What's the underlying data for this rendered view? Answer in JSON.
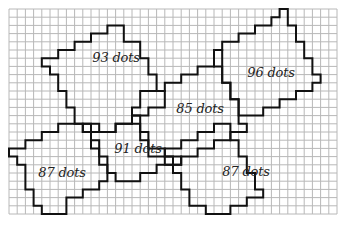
{
  "diagram": {
    "title": "",
    "grid": {
      "origin_px": [
        9,
        9
      ],
      "cell_px": 8.2,
      "cols": 40,
      "rows": 25,
      "line_color": "#b8b8b8",
      "background": "#ffffff"
    },
    "outline_color": "#111111",
    "shapes": [
      {
        "label": "93 dots",
        "label_pos_px": [
          116,
          57
        ],
        "path_grid": [
          [
            13,
            2
          ],
          [
            14,
            2
          ],
          [
            14,
            4
          ],
          [
            16,
            4
          ],
          [
            16,
            6
          ],
          [
            17,
            6
          ],
          [
            17,
            8
          ],
          [
            18,
            8
          ],
          [
            18,
            10
          ],
          [
            19,
            10
          ],
          [
            19,
            12
          ],
          [
            17,
            12
          ],
          [
            17,
            13
          ],
          [
            15,
            13
          ],
          [
            15,
            14
          ],
          [
            13,
            14
          ],
          [
            13,
            15
          ],
          [
            10,
            15
          ],
          [
            10,
            14
          ],
          [
            8,
            14
          ],
          [
            8,
            12
          ],
          [
            7,
            12
          ],
          [
            7,
            10
          ],
          [
            6,
            10
          ],
          [
            6,
            8
          ],
          [
            5,
            8
          ],
          [
            5,
            7
          ],
          [
            4,
            7
          ],
          [
            4,
            6
          ],
          [
            6,
            6
          ],
          [
            6,
            5
          ],
          [
            8,
            5
          ],
          [
            8,
            4
          ],
          [
            10,
            4
          ],
          [
            10,
            3
          ],
          [
            12,
            3
          ],
          [
            12,
            2
          ]
        ]
      },
      {
        "label": "96 dots",
        "label_pos_px": [
          271,
          72
        ],
        "path_grid": [
          [
            33,
            0
          ],
          [
            34,
            0
          ],
          [
            34,
            2
          ],
          [
            35,
            2
          ],
          [
            35,
            4
          ],
          [
            36,
            4
          ],
          [
            36,
            6
          ],
          [
            37,
            6
          ],
          [
            37,
            8
          ],
          [
            38,
            8
          ],
          [
            38,
            9
          ],
          [
            37,
            9
          ],
          [
            37,
            10
          ],
          [
            35,
            10
          ],
          [
            35,
            11
          ],
          [
            33,
            11
          ],
          [
            33,
            12
          ],
          [
            31,
            12
          ],
          [
            31,
            13
          ],
          [
            28,
            13
          ],
          [
            28,
            11
          ],
          [
            27,
            11
          ],
          [
            27,
            9
          ],
          [
            26,
            9
          ],
          [
            26,
            7
          ],
          [
            25,
            7
          ],
          [
            25,
            5
          ],
          [
            26,
            5
          ],
          [
            26,
            4
          ],
          [
            28,
            4
          ],
          [
            28,
            3
          ],
          [
            30,
            3
          ],
          [
            30,
            2
          ],
          [
            32,
            2
          ],
          [
            32,
            1
          ],
          [
            33,
            1
          ]
        ]
      },
      {
        "label": "85 dots",
        "label_pos_px": [
          200,
          108
        ],
        "path_grid": [
          [
            16,
            10
          ],
          [
            19,
            10
          ],
          [
            19,
            9
          ],
          [
            21,
            9
          ],
          [
            21,
            8
          ],
          [
            23,
            8
          ],
          [
            23,
            7
          ],
          [
            25,
            7
          ],
          [
            25,
            5
          ],
          [
            26,
            5
          ],
          [
            26,
            9
          ],
          [
            27,
            9
          ],
          [
            27,
            11
          ],
          [
            28,
            11
          ],
          [
            28,
            14
          ],
          [
            29,
            14
          ],
          [
            29,
            15
          ],
          [
            27,
            15
          ],
          [
            27,
            16
          ],
          [
            25,
            16
          ],
          [
            25,
            17
          ],
          [
            23,
            17
          ],
          [
            23,
            18
          ],
          [
            21,
            18
          ],
          [
            21,
            19
          ],
          [
            19,
            19
          ],
          [
            19,
            18
          ],
          [
            17,
            18
          ],
          [
            17,
            16
          ],
          [
            16,
            16
          ],
          [
            16,
            14
          ],
          [
            15,
            14
          ],
          [
            15,
            12
          ],
          [
            16,
            12
          ]
        ]
      },
      {
        "label": "91 dots",
        "label_pos_px": [
          138,
          148
        ],
        "path_grid": [
          [
            9,
            15
          ],
          [
            10,
            15
          ],
          [
            10,
            16
          ],
          [
            11,
            16
          ],
          [
            11,
            18
          ],
          [
            12,
            18
          ],
          [
            12,
            20
          ],
          [
            13,
            20
          ],
          [
            13,
            21
          ],
          [
            16,
            21
          ],
          [
            16,
            20
          ],
          [
            18,
            20
          ],
          [
            18,
            19
          ],
          [
            21,
            19
          ],
          [
            21,
            18
          ],
          [
            19,
            18
          ],
          [
            19,
            17
          ],
          [
            17,
            17
          ],
          [
            17,
            15
          ],
          [
            16,
            15
          ],
          [
            16,
            13
          ],
          [
            15,
            13
          ],
          [
            15,
            14
          ],
          [
            13,
            14
          ],
          [
            13,
            15
          ],
          [
            11,
            15
          ],
          [
            11,
            14
          ],
          [
            9,
            14
          ]
        ]
      },
      {
        "label": "87 dots",
        "label_pos_px": [
          62,
          172
        ],
        "path_grid": [
          [
            8,
            14
          ],
          [
            9,
            14
          ],
          [
            9,
            15
          ],
          [
            10,
            15
          ],
          [
            10,
            17
          ],
          [
            11,
            17
          ],
          [
            11,
            19
          ],
          [
            12,
            19
          ],
          [
            12,
            21
          ],
          [
            11,
            21
          ],
          [
            11,
            22
          ],
          [
            9,
            22
          ],
          [
            9,
            23
          ],
          [
            7,
            23
          ],
          [
            7,
            25
          ],
          [
            4,
            25
          ],
          [
            4,
            24
          ],
          [
            3,
            24
          ],
          [
            3,
            22
          ],
          [
            2,
            22
          ],
          [
            2,
            19
          ],
          [
            1,
            19
          ],
          [
            1,
            18
          ],
          [
            0,
            18
          ],
          [
            0,
            17
          ],
          [
            2,
            17
          ],
          [
            2,
            16
          ],
          [
            4,
            16
          ],
          [
            4,
            15
          ],
          [
            6,
            15
          ],
          [
            6,
            14
          ]
        ]
      },
      {
        "label": "87 dots",
        "label_pos_px": [
          246,
          171
        ],
        "path_grid": [
          [
            27,
            16
          ],
          [
            28,
            16
          ],
          [
            28,
            18
          ],
          [
            29,
            18
          ],
          [
            29,
            20
          ],
          [
            30,
            20
          ],
          [
            30,
            22
          ],
          [
            31,
            22
          ],
          [
            31,
            23
          ],
          [
            29,
            23
          ],
          [
            29,
            24
          ],
          [
            27,
            24
          ],
          [
            27,
            25
          ],
          [
            24,
            25
          ],
          [
            24,
            24
          ],
          [
            22,
            24
          ],
          [
            22,
            22
          ],
          [
            21,
            22
          ],
          [
            21,
            20
          ],
          [
            20,
            20
          ],
          [
            20,
            18
          ],
          [
            19,
            18
          ],
          [
            19,
            17
          ],
          [
            21,
            17
          ],
          [
            21,
            16
          ],
          [
            23,
            16
          ],
          [
            23,
            15
          ],
          [
            25,
            15
          ],
          [
            25,
            14
          ],
          [
            27,
            14
          ]
        ]
      }
    ]
  }
}
